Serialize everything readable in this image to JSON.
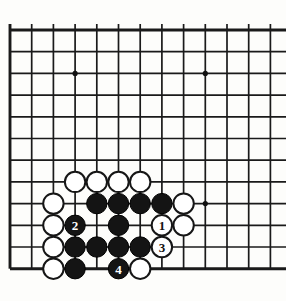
{
  "app": {
    "title": "Go Board Diagram",
    "board_type": "go-goban-corner-diagram"
  },
  "board": {
    "background_color": "#fdfdfb",
    "line_color": "#1a1a1a",
    "black_stone_color": "#141414",
    "white_stone_color": "#ffffff",
    "stone_radius": 10.2,
    "cell_size": 21.7,
    "origin_x": 10,
    "origin_y": 30,
    "columns": 13,
    "rows": 12,
    "edges": {
      "left": true,
      "top": true,
      "bottom": true,
      "right": false
    },
    "star_points": [
      {
        "col": 3,
        "row": 2,
        "label": "hoshi-top-left"
      },
      {
        "col": 9,
        "row": 2,
        "label": "hoshi-top-right"
      },
      {
        "col": 9,
        "row": 8,
        "label": "hoshi-lower-right"
      }
    ],
    "stones": [
      {
        "id": "w-c3-r7",
        "color": "white",
        "col": 3,
        "row": 7,
        "label": ""
      },
      {
        "id": "w-c4-r7",
        "color": "white",
        "col": 4,
        "row": 7,
        "label": ""
      },
      {
        "id": "w-c5-r7",
        "color": "white",
        "col": 5,
        "row": 7,
        "label": ""
      },
      {
        "id": "w-c6-r7",
        "color": "white",
        "col": 6,
        "row": 7,
        "label": ""
      },
      {
        "id": "w-c2-r8",
        "color": "white",
        "col": 2,
        "row": 8,
        "label": ""
      },
      {
        "id": "b-c4-r8",
        "color": "black",
        "col": 4,
        "row": 8,
        "label": ""
      },
      {
        "id": "b-c5-r8",
        "color": "black",
        "col": 5,
        "row": 8,
        "label": ""
      },
      {
        "id": "b-c6-r8",
        "color": "black",
        "col": 6,
        "row": 8,
        "label": ""
      },
      {
        "id": "b-c7-r8",
        "color": "black",
        "col": 7,
        "row": 8,
        "label": ""
      },
      {
        "id": "w-c8-r8",
        "color": "white",
        "col": 8,
        "row": 8,
        "label": ""
      },
      {
        "id": "w-c2-r9",
        "color": "white",
        "col": 2,
        "row": 9,
        "label": ""
      },
      {
        "id": "b-c3-r9",
        "color": "black",
        "col": 3,
        "row": 9,
        "label": "2"
      },
      {
        "id": "b-c5-r9",
        "color": "black",
        "col": 5,
        "row": 9,
        "label": ""
      },
      {
        "id": "w-c7-r9",
        "color": "white",
        "col": 7,
        "row": 9,
        "label": "1"
      },
      {
        "id": "w-c8-r9",
        "color": "white",
        "col": 8,
        "row": 9,
        "label": ""
      },
      {
        "id": "w-c2-r10",
        "color": "white",
        "col": 2,
        "row": 10,
        "label": ""
      },
      {
        "id": "b-c3-r10",
        "color": "black",
        "col": 3,
        "row": 10,
        "label": ""
      },
      {
        "id": "b-c4-r10",
        "color": "black",
        "col": 4,
        "row": 10,
        "label": ""
      },
      {
        "id": "b-c5-r10",
        "color": "black",
        "col": 5,
        "row": 10,
        "label": ""
      },
      {
        "id": "b-c6-r10",
        "color": "black",
        "col": 6,
        "row": 10,
        "label": ""
      },
      {
        "id": "w-c7-r10",
        "color": "white",
        "col": 7,
        "row": 10,
        "label": "3"
      },
      {
        "id": "w-c2-r11",
        "color": "white",
        "col": 2,
        "row": 11,
        "label": ""
      },
      {
        "id": "b-c3-r11",
        "color": "black",
        "col": 3,
        "row": 11,
        "label": ""
      },
      {
        "id": "b-c5-r11",
        "color": "black",
        "col": 5,
        "row": 11,
        "label": "4"
      },
      {
        "id": "w-c6-r11",
        "color": "white",
        "col": 6,
        "row": 11,
        "label": ""
      }
    ],
    "move_sequence": [
      {
        "number": "1",
        "color": "white"
      },
      {
        "number": "2",
        "color": "black"
      },
      {
        "number": "3",
        "color": "white"
      },
      {
        "number": "4",
        "color": "black"
      }
    ]
  }
}
